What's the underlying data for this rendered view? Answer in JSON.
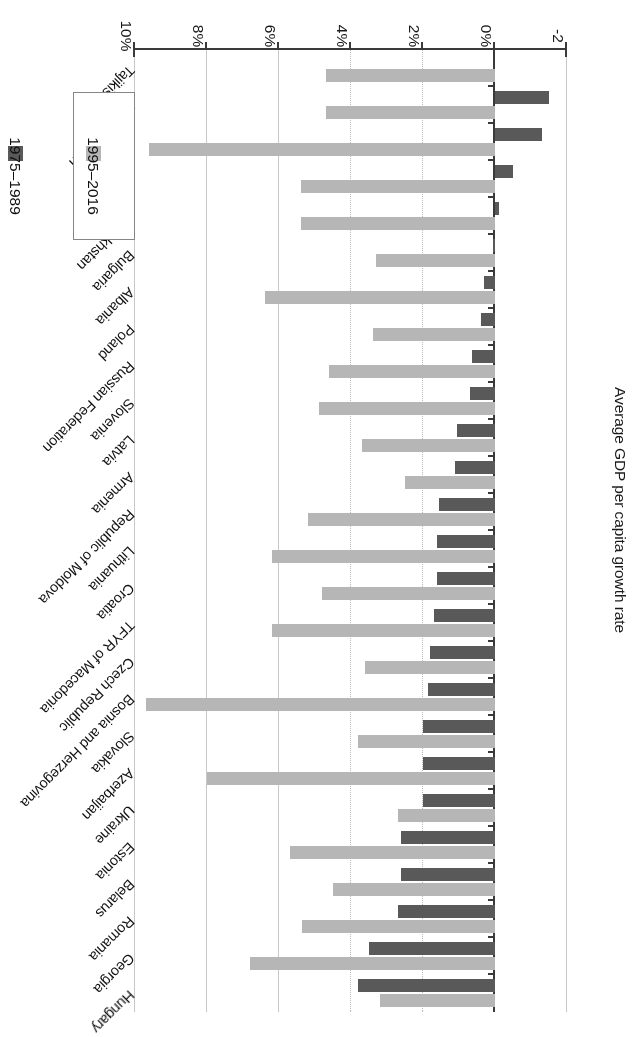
{
  "chart_data": {
    "type": "bar",
    "orientation": "horizontal",
    "title": "",
    "xlabel": "Average GDP per capita growth rate",
    "ylabel": "",
    "xlim": [
      -2,
      10
    ],
    "xtick_labels": [
      "10%",
      "8%",
      "6%",
      "4%",
      "2%",
      "0%",
      "-2"
    ],
    "xtick_values": [
      10,
      8,
      6,
      4,
      2,
      0,
      -2
    ],
    "grid": true,
    "legend_position": "bottom-left",
    "categories": [
      "Tajikistan",
      "Turkmenistan",
      "Uzbekistan",
      "Kyrgyzstan",
      "Kazakhstan",
      "Bulgaria",
      "Albania",
      "Poland",
      "Russian Federation",
      "Slovenia",
      "Latvia",
      "Armenia",
      "Republic of Moldova",
      "Lithuania",
      "Croatia",
      "TFYR of Macedonia",
      "Czech Republic",
      "Bosnia and Herzegovina",
      "Slovakia",
      "Azerbaijan",
      "Ukraine",
      "Estonia",
      "Belarus",
      "Romania",
      "Georgia",
      "Hungary"
    ],
    "series": [
      {
        "name": "1975–1989",
        "color": "#595959",
        "values": [
          null,
          -1.5,
          -1.3,
          -0.5,
          -0.1,
          0.05,
          0.3,
          0.4,
          0.65,
          0.7,
          1.05,
          1.1,
          1.55,
          1.6,
          1.6,
          1.7,
          1.8,
          1.85,
          2.0,
          2.0,
          2.0,
          2.6,
          2.6,
          2.7,
          3.5,
          3.8
        ]
      },
      {
        "name": "1995–2016",
        "color": "#b6b6b6",
        "values": [
          4.7,
          4.7,
          9.6,
          5.4,
          5.4,
          3.3,
          6.4,
          3.4,
          4.6,
          4.9,
          3.7,
          2.5,
          5.2,
          6.2,
          4.8,
          6.2,
          3.6,
          9.7,
          3.8,
          8.0,
          2.7,
          5.7,
          4.5,
          5.35,
          6.8,
          3.2
        ]
      }
    ]
  },
  "legend": {
    "entries": [
      {
        "label": "1975–1989",
        "series": 0
      },
      {
        "label": "1995–2016",
        "series": 1
      }
    ]
  }
}
